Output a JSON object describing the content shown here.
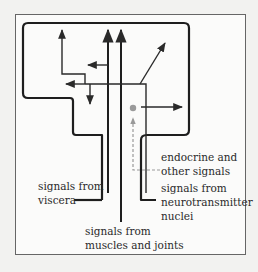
{
  "diagram": {
    "colors": {
      "background": "#f2f2f0",
      "frame_fill": "#fbfbfa",
      "frame_stroke": "#666666",
      "shape_stroke": "#1e1e1e",
      "arrow": "#2a2a2a",
      "dot": "#9a9a9a",
      "dashed": "#999999"
    },
    "labels": {
      "viscera": {
        "line1": "signals from",
        "line2": "viscera"
      },
      "muscles": {
        "line1": "signals from",
        "line2": "muscles and joints"
      },
      "endocrine": {
        "line1": "endocrine and",
        "line2": "other signals"
      },
      "neurotransmitter": {
        "line1": "signals from",
        "line2": "neurotransmitter",
        "line3": "nuclei"
      }
    },
    "icons": {
      "arrowhead": "arrowhead-icon",
      "dot": "signal-dot-icon"
    }
  }
}
